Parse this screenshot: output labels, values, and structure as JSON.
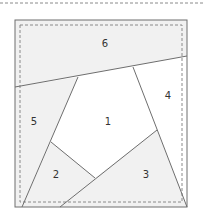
{
  "diagram": {
    "colors": {
      "background": "#ffffff",
      "shaded_fill": "#f1f1f1",
      "line": "#6e6e6e",
      "dashed": "#8a8a8a",
      "label": "#333333"
    },
    "sections": [
      {
        "id": "1",
        "label": "1",
        "shaded": false
      },
      {
        "id": "2",
        "label": "2",
        "shaded": true
      },
      {
        "id": "3",
        "label": "3",
        "shaded": true
      },
      {
        "id": "4",
        "label": "4",
        "shaded": false
      },
      {
        "id": "5",
        "label": "5",
        "shaded": true
      },
      {
        "id": "6",
        "label": "6",
        "shaded": true
      }
    ]
  }
}
